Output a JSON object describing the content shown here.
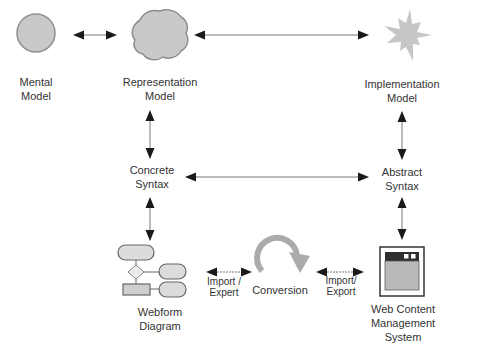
{
  "diagram": {
    "background_color": "#ffffff",
    "colors": {
      "model_shape_fill": "#c9c9c9",
      "model_shape_stroke": "#8f8f8f",
      "splash_fill": "#c6c6c6",
      "arrow_line": "#777777",
      "arrow_head": "#1a1a1a",
      "conversion_arc": "#ababab",
      "flowchart_fill": "#dcdcdc",
      "flowchart_stroke": "#666666",
      "window_titlebar": "#2f2f2f",
      "window_content": "#b9b9b9",
      "text": "#333333"
    },
    "nodes": {
      "mental_model": {
        "label": "Mental\nModel",
        "shape": "circle"
      },
      "representation_model": {
        "label": "Representation\nModel",
        "shape": "blob"
      },
      "implementation_model": {
        "label": "Implementation\nModel",
        "shape": "splash"
      },
      "concrete_syntax": {
        "label": "Concrete\nSyntax",
        "shape": "text-only"
      },
      "abstract_syntax": {
        "label": "Abstract\nSyntax",
        "shape": "text-only"
      },
      "webform_diagram": {
        "label": "Webform\nDiagram",
        "shape": "flowchart-icon"
      },
      "conversion": {
        "label": "Conversion",
        "shape": "circular-arrow-icon"
      },
      "web_content_management_system": {
        "label": "Web Content\nManagement System",
        "shape": "browser-window-icon"
      }
    },
    "edges": [
      {
        "from": "mental_model",
        "to": "representation_model",
        "type": "double-arrow",
        "label": ""
      },
      {
        "from": "representation_model",
        "to": "implementation_model",
        "type": "double-arrow",
        "label": ""
      },
      {
        "from": "representation_model",
        "to": "concrete_syntax",
        "type": "double-arrow",
        "label": ""
      },
      {
        "from": "implementation_model",
        "to": "abstract_syntax",
        "type": "double-arrow",
        "label": ""
      },
      {
        "from": "concrete_syntax",
        "to": "abstract_syntax",
        "type": "double-arrow",
        "label": ""
      },
      {
        "from": "concrete_syntax",
        "to": "webform_diagram",
        "type": "double-arrow",
        "label": ""
      },
      {
        "from": "abstract_syntax",
        "to": "web_content_management_system",
        "type": "double-arrow",
        "label": ""
      },
      {
        "from": "webform_diagram",
        "to": "conversion",
        "type": "double-arrow",
        "label": "Import /\nExpert"
      },
      {
        "from": "conversion",
        "to": "web_content_management_system",
        "type": "double-arrow",
        "label": "Import/\nExport"
      }
    ]
  }
}
